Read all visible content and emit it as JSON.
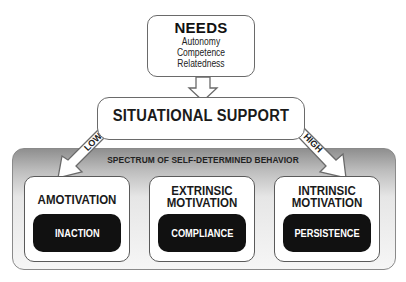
{
  "needs": {
    "title": "NEEDS",
    "items": [
      "Autonomy",
      "Competence",
      "Relatedness"
    ]
  },
  "situational_support": {
    "title": "SITUATIONAL SUPPORT",
    "low_label": "LOW",
    "high_label": "HIGH"
  },
  "spectrum": {
    "title": "SPECTRUM OF SELF-DETERMINED BEHAVIOR",
    "boxes": [
      {
        "title_line1": "AMOTIVATION",
        "title_line2": "",
        "behavior": "INACTION"
      },
      {
        "title_line1": "EXTRINSIC",
        "title_line2": "MOTIVATION",
        "behavior": "COMPLIANCE"
      },
      {
        "title_line1": "INTRINSIC",
        "title_line2": "MOTIVATION",
        "behavior": "PERSISTENCE"
      }
    ]
  },
  "colors": {
    "pill_bg": "#111111",
    "border": "#6a6a6a",
    "panel_gradient_top": "#8f8f8f",
    "panel_gradient_bottom": "#f6f6f6"
  }
}
